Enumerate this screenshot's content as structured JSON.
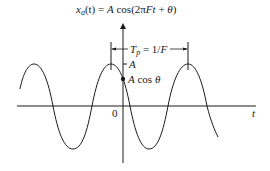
{
  "diagram": {
    "title": {
      "lhs_x": "x",
      "lhs_sub": "a",
      "lhs_rest": "(t) = ",
      "A": "A",
      "cos_open": " cos(2",
      "pi": "π",
      "Ft": "Ft",
      "plus": " + ",
      "theta": "θ",
      "close": ")"
    },
    "period_label": {
      "T": "T",
      "sub": "p",
      "eq": " = 1/",
      "F": "F"
    },
    "amplitude_label": "A",
    "intercept_label": {
      "A": "A",
      "cos": " cos ",
      "theta": "θ"
    },
    "origin_label": "0",
    "time_axis_label": "t",
    "colors": {
      "stroke": "#1a1a1a",
      "background": "#ffffff"
    }
  }
}
